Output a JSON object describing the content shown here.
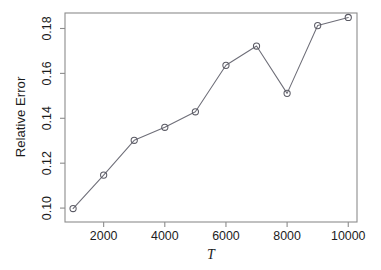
{
  "chart_data": {
    "type": "line",
    "title": "",
    "subtitle": "",
    "xlabel": "T",
    "ylabel": "Relative Error",
    "x": [
      1000,
      2000,
      3000,
      4000,
      5000,
      6000,
      7000,
      8000,
      9000,
      10000
    ],
    "values": [
      0.0998,
      0.1147,
      0.1302,
      0.136,
      0.1429,
      0.1636,
      0.1722,
      0.1511,
      0.1813,
      0.1849
    ],
    "series": [
      {
        "name": "Relative Error",
        "values": [
          0.0998,
          0.1147,
          0.1302,
          0.136,
          0.1429,
          0.1636,
          0.1722,
          0.1511,
          0.1813,
          0.1849
        ]
      }
    ],
    "xlim": [
      736,
      10286
    ],
    "ylim": [
      0.0938,
      0.1869
    ],
    "xticks": [
      2000,
      4000,
      6000,
      8000,
      10000
    ],
    "xticklabels": [
      "2000",
      "4000",
      "6000",
      "8000",
      "10000"
    ],
    "yticks": [
      0.1,
      0.12,
      0.14,
      0.16,
      0.18
    ],
    "yticklabels": [
      "0.10",
      "0.12",
      "0.14",
      "0.16",
      "0.18"
    ],
    "grid": false,
    "legend": false,
    "legend_position": "none",
    "marker": "open-circle",
    "line_style": "solid",
    "annotations": [],
    "colors": {
      "line": "#6e6e78",
      "marker": "#5a5a64",
      "axis": "#8c8c8c",
      "text": "#1c1c1c",
      "background": "#ffffff"
    }
  },
  "layout": {
    "plot_left": 65,
    "plot_right": 357,
    "plot_top": 13,
    "plot_bottom": 222,
    "width": 381,
    "height": 270
  }
}
